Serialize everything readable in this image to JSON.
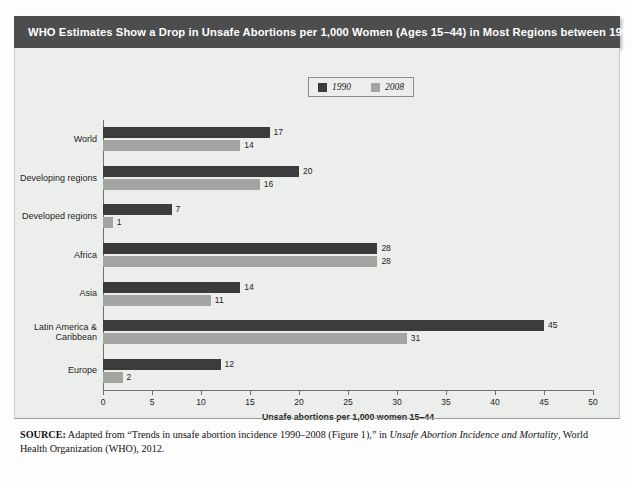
{
  "title": "WHO Estimates Show a Drop in Unsafe Abortions per 1,000 Women (Ages 15–44) in Most Regions between 1990 and 2008",
  "legend": {
    "items": [
      {
        "label": "1990",
        "color": "#3c3c3c"
      },
      {
        "label": "2008",
        "color": "#a3a5a3"
      }
    ]
  },
  "source": {
    "prefix": "SOURCE:",
    "part1": " Adapted from “Trends in unsafe abortion incidence 1990–2008 (Figure 1),” in ",
    "italic": "Unsafe Abortion Incidence and Mortality",
    "part2": ", World Health Organization (WHO), 2012."
  },
  "chart_data": {
    "type": "bar",
    "orientation": "horizontal",
    "title": "WHO Estimates Show a Drop in Unsafe Abortions per 1,000 Women (Ages 15–44) in Most Regions between 1990 and 2008",
    "xlabel": "Unsafe abortions per 1,000 women 15–44",
    "ylabel": "",
    "xlim": [
      0,
      50
    ],
    "xticks": [
      0,
      5,
      10,
      15,
      20,
      25,
      30,
      35,
      40,
      45,
      50
    ],
    "grid": false,
    "legend_position": "top-center",
    "categories": [
      "World",
      "Developing regions",
      "Developed regions",
      "Africa",
      "Asia",
      "Latin America &\nCaribbean",
      "Europe"
    ],
    "series": [
      {
        "name": "1990",
        "color": "#3c3c3c",
        "values": [
          17,
          20,
          7,
          28,
          14,
          45,
          12
        ]
      },
      {
        "name": "2008",
        "color": "#a3a5a3",
        "values": [
          14,
          16,
          1,
          28,
          11,
          31,
          2
        ]
      }
    ]
  }
}
